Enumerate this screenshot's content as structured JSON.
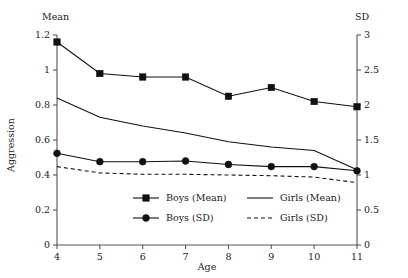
{
  "chart_data": {
    "type": "line",
    "title": "",
    "xlabel": "Age",
    "ylabel": "Aggression",
    "left_axis_label": "Mean",
    "right_axis_label": "SD",
    "x": [
      4,
      5,
      6,
      7,
      8,
      9,
      10,
      11
    ],
    "xlim": [
      4,
      11
    ],
    "xticks": [
      "4",
      "5",
      "6",
      "7",
      "8",
      "9",
      "10",
      "11"
    ],
    "ylim_left": [
      0,
      1.2
    ],
    "yticks_left": [
      "0",
      "0.2",
      "0.4",
      "0.6",
      "0.8",
      "1",
      "1.2"
    ],
    "ylim_right": [
      0,
      3
    ],
    "yticks_right": [
      "0",
      "0.5",
      "1",
      "1.5",
      "2",
      "2.5",
      "3"
    ],
    "grid": false,
    "legend_position": "inside-bottom-center",
    "series": [
      {
        "name": "Boys (Mean)",
        "axis": "left",
        "marker": "square",
        "style": "solid",
        "values": [
          1.16,
          0.98,
          0.96,
          0.96,
          0.85,
          0.9,
          0.82,
          0.79
        ]
      },
      {
        "name": "Girls (Mean)",
        "axis": "left",
        "marker": "none",
        "style": "solid",
        "values": [
          0.84,
          0.73,
          0.68,
          0.64,
          0.59,
          0.56,
          0.54,
          0.43
        ]
      },
      {
        "name": "Boys (SD)",
        "axis": "right",
        "marker": "circle",
        "style": "solid",
        "values": [
          1.31,
          1.19,
          1.19,
          1.2,
          1.15,
          1.12,
          1.12,
          1.06
        ]
      },
      {
        "name": "Girls (SD)",
        "axis": "right",
        "marker": "none",
        "style": "dashed",
        "values": [
          1.12,
          1.03,
          1.01,
          1.01,
          1.0,
          0.99,
          0.97,
          0.89
        ]
      }
    ]
  },
  "legend": {
    "entries": [
      {
        "label": "Boys (Mean)",
        "marker": "square",
        "style": "solid"
      },
      {
        "label": "Girls (Mean)",
        "marker": "none",
        "style": "solid"
      },
      {
        "label": "Boys (SD)",
        "marker": "circle",
        "style": "solid"
      },
      {
        "label": "Girls (SD)",
        "marker": "none",
        "style": "dashed"
      }
    ]
  }
}
